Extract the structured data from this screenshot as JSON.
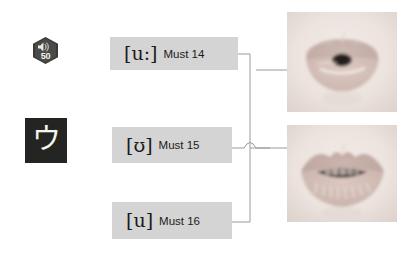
{
  "page": {
    "background_color": "#ffffff"
  },
  "left_column": {
    "audio_badge": {
      "icon": "speaker-icon",
      "number": "50",
      "badge_color": "#3a3a38",
      "text_color": "#f2f2ee"
    },
    "kana_tile": {
      "character": "ウ",
      "background_color": "#242422",
      "text_color": "#f4f4f0"
    }
  },
  "labels": [
    {
      "id": "must-14",
      "ipa": "[u:]",
      "caption": "Must 14",
      "background_color": "#d4d4d4",
      "text_color": "#1b1b1b"
    },
    {
      "id": "must-15",
      "ipa": "[ʊ]",
      "caption": "Must 15",
      "background_color": "#d4d4d4",
      "text_color": "#1b1b1b"
    },
    {
      "id": "must-16",
      "ipa": "[u]",
      "caption": "Must 16",
      "background_color": "#d4d4d4",
      "text_color": "#1b1b1b"
    }
  ],
  "images": [
    {
      "id": "lips-rounded",
      "alt": "Photograph of rounded pursed lips",
      "description": "mouth with lips rounded and protruded, small dark opening"
    },
    {
      "id": "lips-teeth",
      "alt": "Photograph of lips with teeth visible",
      "description": "mouth slightly open showing upper and lower teeth"
    }
  ],
  "connectors": {
    "line_color": "#9a9a9a",
    "style": "orthogonal-with-hop",
    "description": "Labels 14 and 16 join a vertical trunk that routes to the lower image; label 15 routes right to the upper image, hopping over the trunk"
  }
}
